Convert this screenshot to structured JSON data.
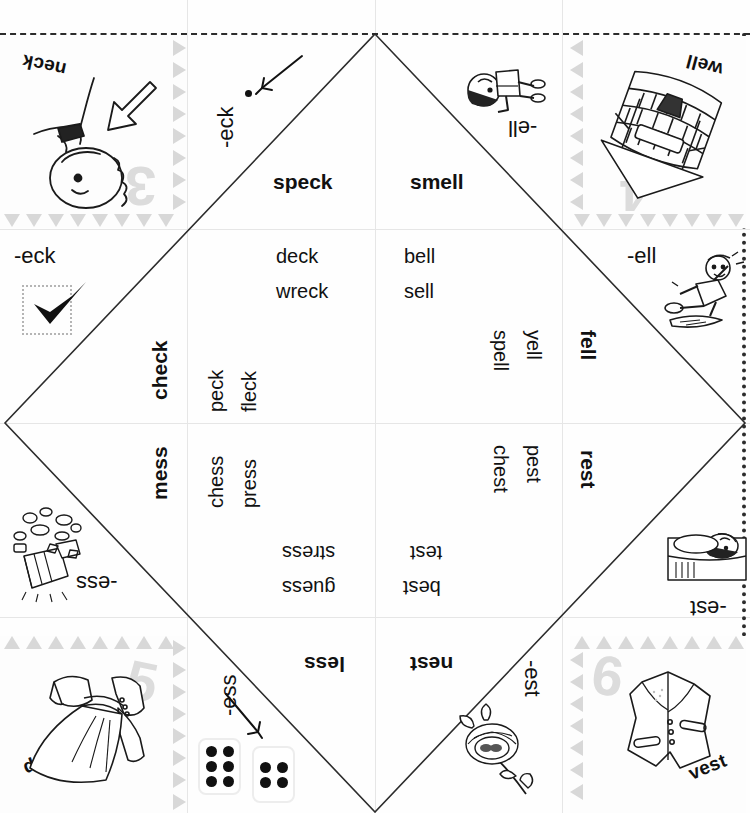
{
  "worksheet": {
    "type": "fortune-teller-cootie-catcher",
    "title": "Word Family Fortune Teller",
    "word_families": [
      "-eck",
      "-ell",
      "-ess",
      "-est"
    ]
  },
  "corner_cards": [
    {
      "id": "card-neck",
      "word": "neck",
      "number": "3",
      "art": "girl-neck-arrow",
      "position": "top-left"
    },
    {
      "id": "card-well",
      "word": "well",
      "number": "4",
      "art": "stone-well",
      "position": "top-right"
    },
    {
      "id": "card-dress",
      "word": "dress",
      "number": "5",
      "art": "dress",
      "position": "bottom-left"
    },
    {
      "id": "card-vest",
      "word": "vest",
      "number": "6",
      "art": "vest",
      "position": "bottom-right"
    }
  ],
  "outer_flaps": [
    {
      "id": "flap-eck-left",
      "rime": "-eck",
      "marker": "check-mark"
    },
    {
      "id": "flap-eck-top",
      "rime": "-eck",
      "marker": "one-dot"
    },
    {
      "id": "flap-ell-top",
      "rime": "-ell",
      "marker": "boy-art"
    },
    {
      "id": "flap-ell-right",
      "rime": "-ell",
      "marker": "fell-boy-art"
    },
    {
      "id": "flap-ess-left",
      "rime": "-ess",
      "marker": "mess-art"
    },
    {
      "id": "flap-ess-bottom",
      "rime": "-ess",
      "marker": "dice-pair"
    },
    {
      "id": "flap-est-bottom",
      "rime": "-est",
      "marker": "nest-art"
    },
    {
      "id": "flap-est-right",
      "rime": "-est",
      "marker": "rest-art"
    }
  ],
  "headwords": [
    {
      "id": "speck",
      "label": "speck",
      "family": "-eck"
    },
    {
      "id": "smell",
      "label": "smell",
      "family": "-ell"
    },
    {
      "id": "check",
      "label": "check",
      "family": "-eck"
    },
    {
      "id": "fell",
      "label": "fell",
      "family": "-ell"
    },
    {
      "id": "mess",
      "label": "mess",
      "family": "-ess"
    },
    {
      "id": "rest",
      "label": "rest",
      "family": "-est"
    },
    {
      "id": "less",
      "label": "less",
      "family": "-ess"
    },
    {
      "id": "nest",
      "label": "nest",
      "family": "-est"
    }
  ],
  "inner_words": {
    "speck_panel": [
      "deck",
      "wreck"
    ],
    "smell_panel": [
      "bell",
      "sell"
    ],
    "check_panel": [
      "peck",
      "fleck"
    ],
    "fell_panel": [
      "yell",
      "spell"
    ],
    "mess_panel": [
      "chess",
      "press"
    ],
    "rest_panel": [
      "pest",
      "chest"
    ],
    "less_panel": [
      "stress",
      "guess"
    ],
    "nest_panel": [
      "best",
      "test"
    ]
  },
  "dice": [
    {
      "id": "die-six",
      "pips": 6
    },
    {
      "id": "die-four",
      "pips": 4
    }
  ],
  "colors": {
    "ink": "#111111",
    "fold_line": "#2c2c2c",
    "grid_line": "#e6e6e6",
    "watermark": "#dcdcdc",
    "triangle_border": "#d8d8d8"
  }
}
